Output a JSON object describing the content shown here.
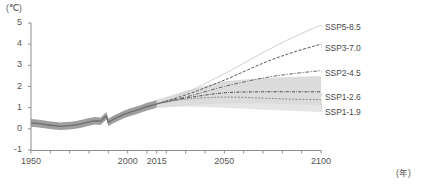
{
  "axes": {
    "y_unit": "(℃)",
    "x_unit": "(年)",
    "y_ticks": [
      "5",
      "4",
      "3",
      "2",
      "1",
      "0",
      "-1"
    ],
    "x_ticks": [
      "1950",
      "2000",
      "2015",
      "2050",
      "2100"
    ]
  },
  "legend": {
    "items": [
      {
        "label": "SSP5-8.5"
      },
      {
        "label": "SSP3-7.0"
      },
      {
        "label": "SSP2-4.5"
      },
      {
        "label": "SSP1-2.6"
      },
      {
        "label": "SSP1-1.9"
      }
    ]
  },
  "chart_data": {
    "type": "line",
    "title": "",
    "xlabel": "(年)",
    "ylabel": "(℃)",
    "xlim": [
      1950,
      2100
    ],
    "ylim": [
      -1,
      5
    ],
    "grid": false,
    "legend_position": "right",
    "x_tick_values": [
      1950,
      1960,
      1970,
      1980,
      1990,
      2000,
      2010,
      2015,
      2020,
      2030,
      2040,
      2050,
      2060,
      2070,
      2080,
      2090,
      2100
    ],
    "x_tick_labels_shown": [
      1950,
      2000,
      2015,
      2050,
      2100
    ],
    "y_tick_values": [
      -1,
      0,
      1,
      2,
      3,
      4,
      5
    ],
    "historical": {
      "name": "Historical observations",
      "color": "#6e6e6e",
      "band_color": "#9a9a9a",
      "x": [
        1950,
        1953,
        1956,
        1959,
        1962,
        1965,
        1968,
        1971,
        1974,
        1977,
        1980,
        1983,
        1986,
        1989,
        1990,
        1992,
        1995,
        1998,
        2001,
        2004,
        2007,
        2010,
        2013,
        2015
      ],
      "values": [
        0.28,
        0.26,
        0.22,
        0.18,
        0.15,
        0.12,
        0.14,
        0.16,
        0.2,
        0.26,
        0.33,
        0.38,
        0.36,
        0.62,
        0.3,
        0.42,
        0.55,
        0.68,
        0.78,
        0.86,
        0.95,
        1.05,
        1.12,
        1.18
      ],
      "band_lower": [
        0.1,
        0.08,
        0.04,
        0.0,
        -0.03,
        -0.06,
        -0.04,
        -0.02,
        0.02,
        0.08,
        0.15,
        0.2,
        0.18,
        0.44,
        0.12,
        0.24,
        0.37,
        0.5,
        0.6,
        0.68,
        0.77,
        0.87,
        0.94,
        1.0
      ],
      "band_upper": [
        0.46,
        0.44,
        0.4,
        0.36,
        0.33,
        0.3,
        0.32,
        0.34,
        0.38,
        0.44,
        0.51,
        0.56,
        0.54,
        0.8,
        0.48,
        0.6,
        0.73,
        0.86,
        0.96,
        1.04,
        1.13,
        1.23,
        1.3,
        1.36
      ]
    },
    "series": [
      {
        "name": "SSP5-8.5",
        "style": "solid",
        "color": "#c9c9c9",
        "x": [
          2015,
          2030,
          2050,
          2070,
          2085,
          2100
        ],
        "values": [
          1.18,
          1.7,
          2.6,
          3.6,
          4.3,
          4.9
        ]
      },
      {
        "name": "SSP3-7.0",
        "style": "dashed",
        "color": "#5a5a5a",
        "x": [
          2015,
          2030,
          2050,
          2070,
          2085,
          2100
        ],
        "values": [
          1.18,
          1.6,
          2.3,
          3.1,
          3.6,
          4.0
        ]
      },
      {
        "name": "SSP2-4.5",
        "style": "dashdot",
        "color": "#6a6a6a",
        "x": [
          2015,
          2030,
          2050,
          2070,
          2085,
          2100
        ],
        "values": [
          1.18,
          1.5,
          2.0,
          2.4,
          2.6,
          2.75
        ]
      },
      {
        "name": "SSP1-2.6",
        "style": "dashdot-dense",
        "color": "#4a4a4a",
        "x": [
          2015,
          2030,
          2050,
          2070,
          2085,
          2100
        ],
        "values": [
          1.18,
          1.45,
          1.7,
          1.75,
          1.75,
          1.75
        ],
        "band_lower": [
          1.0,
          1.1,
          1.2,
          1.2,
          1.15,
          1.1
        ],
        "band_upper": [
          1.36,
          1.8,
          2.25,
          2.4,
          2.45,
          2.5
        ],
        "band_color": "#cfcfcf"
      },
      {
        "name": "SSP1-1.9",
        "style": "dashed-fine",
        "color": "#8a8a8a",
        "x": [
          2015,
          2030,
          2050,
          2070,
          2085,
          2100
        ],
        "values": [
          1.18,
          1.4,
          1.5,
          1.45,
          1.4,
          1.38
        ],
        "band_lower": [
          1.0,
          1.05,
          1.0,
          0.9,
          0.85,
          0.8
        ],
        "band_upper": [
          1.36,
          1.75,
          2.0,
          2.0,
          1.95,
          1.95
        ],
        "band_color": "#dcdcdc"
      }
    ]
  }
}
